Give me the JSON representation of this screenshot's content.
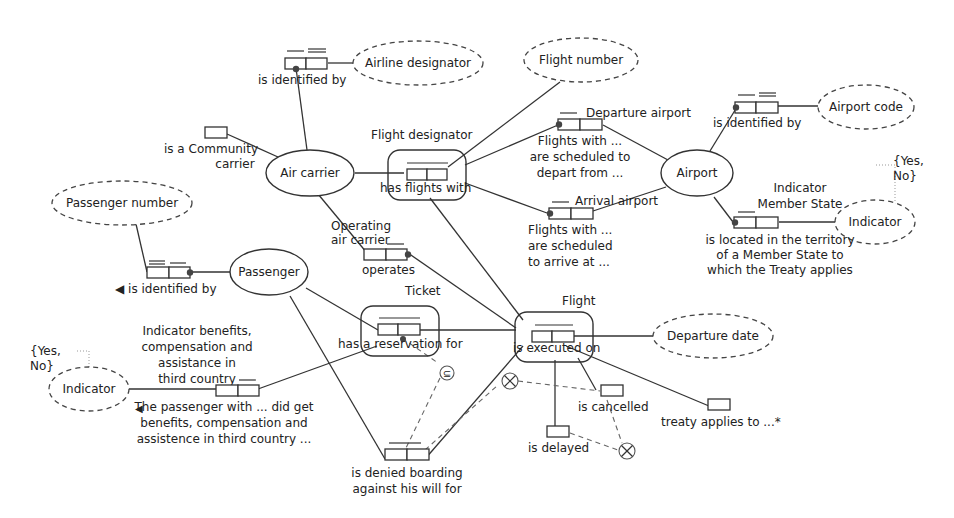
{
  "entities": {
    "air_carrier": "Air carrier",
    "airport": "Airport",
    "passenger": "Passenger"
  },
  "value_types": {
    "airline_designator": "Airline designator",
    "flight_number": "Flight number",
    "airport_code": "Airport code",
    "passenger_number": "Passenger number",
    "indicator_right": "Indicator",
    "indicator_left": "Indicator",
    "departure_date": "Departure date"
  },
  "value_constraints": {
    "right": [
      "{Yes,",
      "No}"
    ],
    "left": [
      "{Yes,",
      "No}"
    ]
  },
  "objectified": {
    "flight_designator": "Flight designator",
    "ticket": "Ticket",
    "flight": "Flight"
  },
  "roles": {
    "air_carrier_identified_by": "is identified by",
    "is_community_carrier": [
      "is a Community",
      "carrier"
    ],
    "has_flights_with": "has flights with",
    "departure_airport_name": "Departure airport",
    "scheduled_depart": [
      "Flights with ...",
      "are scheduled to",
      "depart from ..."
    ],
    "arrival_airport_name": "Arrival airport",
    "scheduled_arrive": [
      "Flights with ...",
      "are scheduled",
      "to arrive at ..."
    ],
    "airport_identified_by": "is identified by",
    "indicator_member_state": [
      "Indicator",
      "Member State"
    ],
    "located_in_territory": [
      "is located in the territory",
      "of a Member State to",
      "which the Treaty applies"
    ],
    "passenger_identified_by": "◀ is identified by",
    "operating_air_carrier": [
      "Operating",
      "air carrier"
    ],
    "operates": "operates",
    "has_reservation_for": "has a reservation for",
    "is_executed_on": "is executed on",
    "indicator_benefits": [
      "Indicator benefits,",
      "compensation and",
      "assistance in",
      "third country"
    ],
    "passenger_did_get": [
      "The passenger with ... did get",
      "benefits, compensation and",
      "assistence in third country ..."
    ],
    "passenger_did_get_arrow": "◀",
    "is_cancelled": "is cancelled",
    "is_delayed": "is delayed",
    "treaty_applies_to": "treaty applies to ...*",
    "denied_boarding": [
      "is denied boarding",
      "against his will for"
    ]
  },
  "constraints": {
    "subset": "⊆",
    "exclusion": "⊗"
  }
}
